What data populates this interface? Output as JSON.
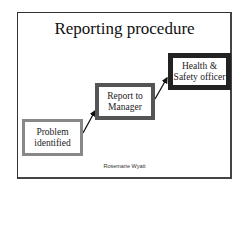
{
  "slide": {
    "title": "Reporting procedure",
    "steps": [
      {
        "line1": "Problem",
        "line2": "identified"
      },
      {
        "line1": "Report to",
        "line2": "Manager"
      },
      {
        "line1": "Health &",
        "line2": "Safety officer"
      }
    ],
    "author": "Rosemarie Wyatt"
  }
}
